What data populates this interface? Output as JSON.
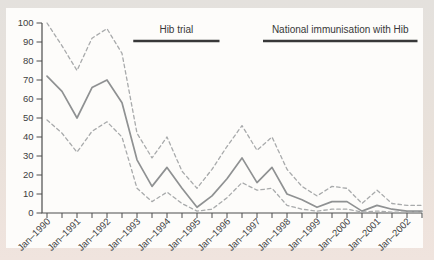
{
  "chart_data": {
    "type": "line",
    "x": [
      "Jan–1990",
      "Jul–1990",
      "Jan–1991",
      "Jul–1991",
      "Jan–1992",
      "Jul–1992",
      "Jan–1993",
      "Jul–1993",
      "Jan–1994",
      "Jul–1994",
      "Jan–1995",
      "Jul–1995",
      "Jan–1996",
      "Jul–1996",
      "Jan–1997",
      "Jul–1997",
      "Jan–1998",
      "Jul–1998",
      "Jan–1999",
      "Jul–1999",
      "Jan–2000",
      "Jul–2000",
      "Jan–2001",
      "Jul–2001",
      "Jan–2002",
      "Jul–2002"
    ],
    "x_tick_labels": [
      "Jan–1990",
      "Jan–1991",
      "Jan–1992",
      "Jan–1993",
      "Jan–1994",
      "Jan–1995",
      "Jan–1996",
      "Jan–1997",
      "Jan–1998",
      "Jan–1999",
      "Jan–2000",
      "Jan–2001",
      "Jan–2002"
    ],
    "ylim": [
      0,
      100
    ],
    "yticks": [
      0,
      10,
      20,
      30,
      40,
      50,
      60,
      70,
      80,
      90,
      100
    ],
    "grid": false,
    "legend": "none",
    "series": [
      {
        "name": "incidence",
        "style": "solid",
        "values": [
          72,
          64,
          50,
          66,
          70,
          58,
          28,
          14,
          24,
          13,
          3,
          9,
          18,
          29,
          16,
          24,
          10,
          7,
          3,
          6,
          6,
          1,
          4,
          2,
          1,
          1
        ]
      },
      {
        "name": "upper-95-ci",
        "style": "dashed",
        "values": [
          100,
          88,
          75,
          92,
          97,
          84,
          42,
          29,
          40,
          22,
          13,
          23,
          35,
          46,
          33,
          40,
          23,
          14,
          9,
          14,
          13,
          5,
          12,
          5,
          4,
          4
        ]
      },
      {
        "name": "lower-95-ci",
        "style": "dashed",
        "values": [
          49,
          42,
          32,
          43,
          48,
          40,
          13,
          6,
          11,
          5,
          1,
          2,
          8,
          16,
          12,
          13,
          4,
          2,
          1,
          2,
          2,
          0.5,
          1,
          0.5,
          0.5,
          0.5
        ]
      }
    ],
    "annotations": [
      {
        "label": "Hib trial",
        "from_index": 5.75,
        "to_index": 11.5
      },
      {
        "label": "National immunisation with Hib",
        "from_index": 14.4,
        "to_index": 24.7
      }
    ]
  },
  "colors": {
    "frame": "#e9e1da",
    "panel": "#fdfcfa",
    "axis": "#4d4d4d",
    "tick_text": "#3e3e3e",
    "trend": "#8f9192",
    "ci": "#a8aaab",
    "annotation": "#383838"
  }
}
